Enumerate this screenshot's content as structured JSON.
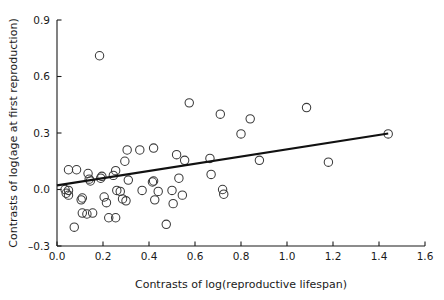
{
  "chart_data": {
    "type": "scatter",
    "title": "",
    "xlabel": "Contrasts of log(reproductive lifespan)",
    "ylabel": "Contrasts of log(age at first reproduction)",
    "xlim": [
      0.0,
      1.6
    ],
    "ylim": [
      -0.3,
      0.9
    ],
    "xticks": [
      0.0,
      0.2,
      0.4,
      0.6,
      0.8,
      1.0,
      1.2,
      1.4,
      1.6
    ],
    "xtick_labels": [
      "0.0",
      "0.2",
      "0.4",
      "0.6",
      "0.8",
      "1.0",
      "1.2",
      "1.4",
      "1.6"
    ],
    "yticks": [
      -0.3,
      0.0,
      0.3,
      0.6,
      0.9
    ],
    "ytick_labels": [
      "–0.3",
      "0.0",
      "0.3",
      "0.6",
      "0.9"
    ],
    "grid": false,
    "legend": null,
    "marker": "open-circle",
    "marker_size": 4.2,
    "point_color": "#3a3a3a",
    "line_color": "#111111",
    "points": [
      [
        0.035,
        0.0
      ],
      [
        0.04,
        -0.02
      ],
      [
        0.05,
        0.105
      ],
      [
        0.05,
        -0.005
      ],
      [
        0.05,
        -0.03
      ],
      [
        0.075,
        -0.2
      ],
      [
        0.085,
        0.105
      ],
      [
        0.105,
        -0.055
      ],
      [
        0.11,
        -0.045
      ],
      [
        0.11,
        -0.125
      ],
      [
        0.13,
        -0.13
      ],
      [
        0.135,
        0.085
      ],
      [
        0.14,
        0.055
      ],
      [
        0.145,
        0.045
      ],
      [
        0.155,
        -0.125
      ],
      [
        0.185,
        0.71
      ],
      [
        0.19,
        0.06
      ],
      [
        0.195,
        0.07
      ],
      [
        0.205,
        -0.04
      ],
      [
        0.215,
        -0.07
      ],
      [
        0.225,
        -0.15
      ],
      [
        0.245,
        0.075
      ],
      [
        0.255,
        0.1
      ],
      [
        0.255,
        -0.15
      ],
      [
        0.26,
        -0.005
      ],
      [
        0.275,
        -0.01
      ],
      [
        0.285,
        -0.05
      ],
      [
        0.295,
        0.15
      ],
      [
        0.3,
        -0.06
      ],
      [
        0.305,
        0.21
      ],
      [
        0.31,
        0.05
      ],
      [
        0.36,
        0.21
      ],
      [
        0.37,
        -0.005
      ],
      [
        0.415,
        0.04
      ],
      [
        0.42,
        0.22
      ],
      [
        0.42,
        0.045
      ],
      [
        0.425,
        -0.055
      ],
      [
        0.44,
        -0.01
      ],
      [
        0.475,
        -0.185
      ],
      [
        0.5,
        -0.005
      ],
      [
        0.505,
        -0.075
      ],
      [
        0.52,
        0.185
      ],
      [
        0.53,
        0.06
      ],
      [
        0.545,
        -0.03
      ],
      [
        0.555,
        0.155
      ],
      [
        0.575,
        0.46
      ],
      [
        0.665,
        0.165
      ],
      [
        0.67,
        0.08
      ],
      [
        0.71,
        0.4
      ],
      [
        0.72,
        0.0
      ],
      [
        0.725,
        -0.025
      ],
      [
        0.8,
        0.295
      ],
      [
        0.84,
        0.375
      ],
      [
        0.88,
        0.155
      ],
      [
        1.085,
        0.435
      ],
      [
        1.18,
        0.145
      ],
      [
        1.44,
        0.295
      ]
    ],
    "fit_line": {
      "x": [
        0.0,
        1.44
      ],
      "y": [
        0.022,
        0.297
      ]
    }
  }
}
